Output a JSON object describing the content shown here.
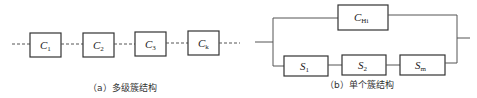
{
  "figure_a": {
    "caption": "（a）多级簇结构",
    "nodes": [
      {
        "main": "C",
        "sub": "1"
      },
      {
        "main": "C",
        "sub": "2"
      },
      {
        "main": "C",
        "sub": "3"
      },
      {
        "main": "C",
        "sub": "k"
      }
    ]
  },
  "figure_b": {
    "caption": "（b）单个簇结构",
    "top_node": {
      "main": "C",
      "sub": "Hi"
    },
    "bottom_nodes": [
      {
        "main": "S",
        "sub": "1"
      },
      {
        "main": "S",
        "sub": "2"
      },
      {
        "main": "S",
        "sub": "m"
      }
    ]
  },
  "colors": {
    "stroke": "#333333",
    "background": "#ffffff"
  }
}
